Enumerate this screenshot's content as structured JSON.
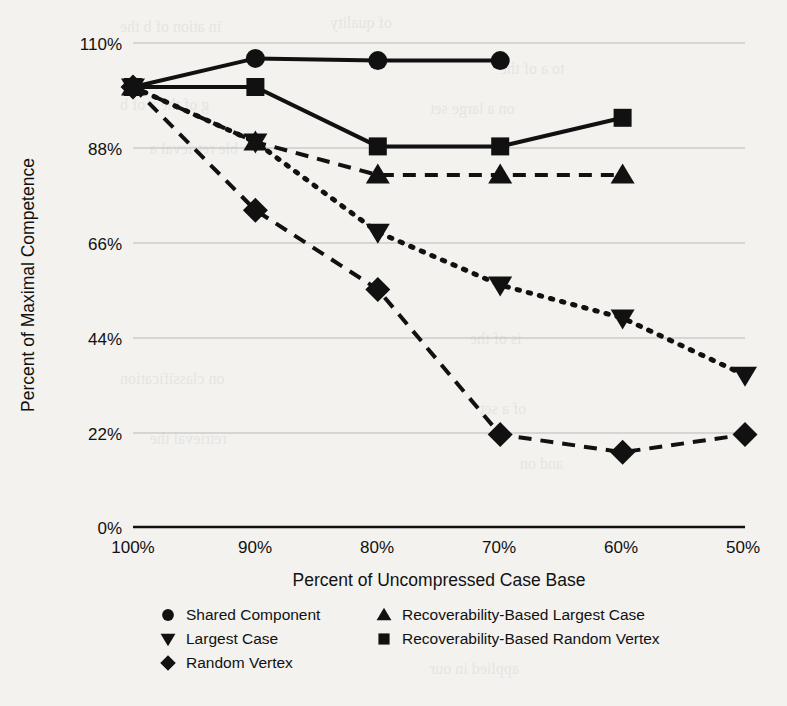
{
  "chart_data": {
    "type": "line",
    "title": "",
    "xlabel": "Percent of Uncompressed Case Base",
    "ylabel": "Percent of Maximal Competence",
    "categories": [
      "100%",
      "90%",
      "80%",
      "70%",
      "60%",
      "50%"
    ],
    "x": [
      100,
      90,
      80,
      70,
      60,
      50
    ],
    "xlim": [
      100,
      50
    ],
    "ylim": [
      0,
      110
    ],
    "yticks": [
      0,
      22,
      44,
      66,
      88,
      110
    ],
    "ytick_labels": [
      "0%",
      "22%",
      "44%",
      "66%",
      "88%",
      "110%"
    ],
    "xtick_labels": [
      "100%",
      "90%",
      "80%",
      "70%",
      "60%",
      "50%"
    ],
    "grid": true,
    "legend_position": "bottom",
    "series": [
      {
        "name": "Shared Component",
        "marker": "circle",
        "linestyle": "solid",
        "color": "#111111",
        "x": [
          100,
          90,
          80,
          70
        ],
        "values": [
          100,
          106.5,
          106,
          106
        ]
      },
      {
        "name": "Largest Case",
        "marker": "triangle-down",
        "linestyle": "dotted",
        "color": "#111111",
        "x": [
          100,
          90,
          80,
          70,
          60,
          50
        ],
        "values": [
          100,
          87.5,
          67,
          55,
          47.5,
          34.5
        ]
      },
      {
        "name": "Random Vertex",
        "marker": "diamond",
        "linestyle": "dashed",
        "color": "#111111",
        "x": [
          100,
          90,
          80,
          70,
          60,
          50
        ],
        "values": [
          100,
          72,
          54,
          21,
          17,
          21
        ]
      },
      {
        "name": "Recoverability-Based Largest Case",
        "marker": "triangle-up",
        "linestyle": "dashed",
        "color": "#111111",
        "x": [
          100,
          90,
          80,
          70,
          60
        ],
        "values": [
          100,
          87.5,
          80,
          80,
          80
        ]
      },
      {
        "name": "Recoverability-Based Random Vertex",
        "marker": "square",
        "linestyle": "solid",
        "color": "#111111",
        "x": [
          100,
          90,
          80,
          70,
          60
        ],
        "values": [
          100,
          100,
          86.5,
          86.5,
          93
        ]
      }
    ]
  },
  "legend": {
    "column_left": [
      {
        "label": "Shared Component",
        "marker": "circle"
      },
      {
        "label": "Largest Case",
        "marker": "triangle-down"
      },
      {
        "label": "Random Vertex",
        "marker": "diamond"
      }
    ],
    "column_right": [
      {
        "label": "Recoverability-Based Largest Case",
        "marker": "triangle-up"
      },
      {
        "label": "Recoverability-Based Random Vertex",
        "marker": "square"
      }
    ]
  },
  "colors": {
    "ink": "#111111",
    "grid": "#b9b9b9",
    "page": "#f3f2ef"
  }
}
